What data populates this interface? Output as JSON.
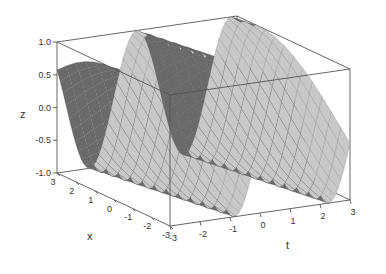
{
  "chart_data": {
    "type": "surface3d",
    "title": "",
    "function_description": "periodic wave surface z(x,t), ridges running along x, ~2 periods over t",
    "x": {
      "label": "x",
      "range": [
        -3,
        3
      ],
      "ticks": [
        3,
        2,
        1,
        0,
        -1,
        -2,
        -3
      ]
    },
    "t": {
      "label": "t",
      "range": [
        -3,
        3
      ],
      "ticks": [
        -3,
        -2,
        -1,
        0,
        1,
        2,
        3
      ]
    },
    "z": {
      "label": "z",
      "range": [
        -1.0,
        1.0
      ],
      "ticks": [
        "1.0",
        "0.5",
        "0.0",
        "-0.5",
        "-1.0"
      ]
    },
    "grid": false,
    "legend": null,
    "surface": {
      "frequency_t": 2.0,
      "frequency_x": 0.35,
      "phase": 1.2,
      "mesh_lines_t": 60,
      "mesh_lines_x": 12
    },
    "colors": {
      "surface_light": "#c8c8c8",
      "surface_dark": "#6a6a6a",
      "mesh": "#555555",
      "box": "#555555",
      "background": "#ffffff"
    }
  },
  "projection": {
    "origin_corner_px": [
      57,
      173
    ],
    "x_axis_end_px": [
      170,
      226
    ],
    "t_axis_end_px": [
      350,
      200
    ],
    "z_height_px": 131
  },
  "labels": {
    "z_title": "z",
    "x_title": "x",
    "t_title": "t"
  }
}
